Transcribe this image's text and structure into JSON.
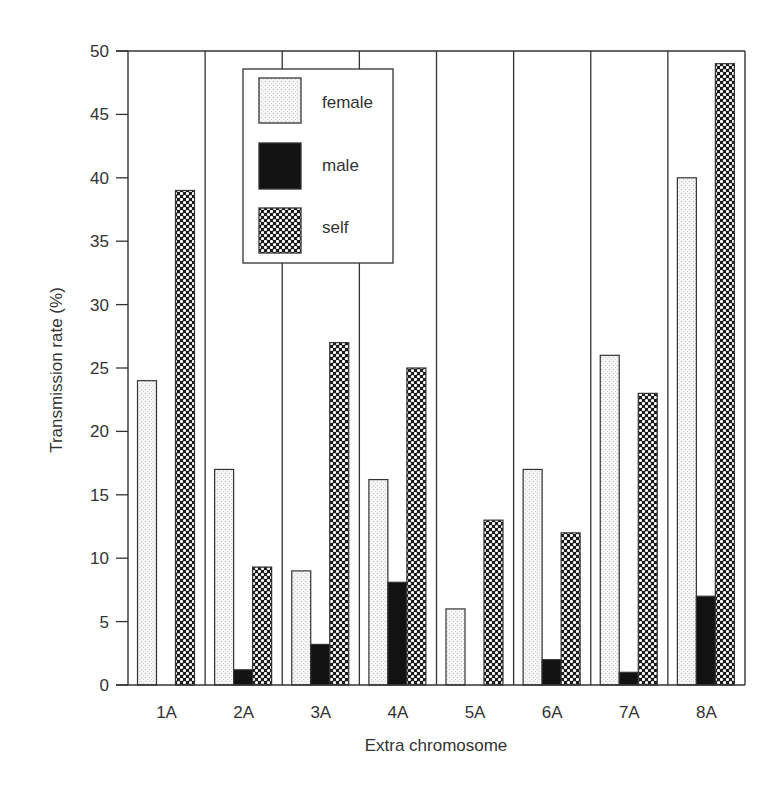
{
  "chart_data": {
    "type": "bar",
    "title": "",
    "xlabel": "Extra chromosome",
    "ylabel": "Transmission rate (%)",
    "ylim": [
      0,
      50
    ],
    "yticks": [
      0,
      5,
      10,
      15,
      20,
      25,
      30,
      35,
      40,
      45,
      50
    ],
    "grid": false,
    "group_dividers": true,
    "legend_position": "upper-left-center (inside plot)",
    "categories": [
      "1A",
      "2A",
      "3A",
      "4A",
      "5A",
      "6A",
      "7A",
      "8A"
    ],
    "series": [
      {
        "name": "female",
        "pattern": "light-stipple",
        "values": [
          24,
          17,
          9,
          16.2,
          6,
          17,
          26,
          40
        ]
      },
      {
        "name": "male",
        "pattern": "solid-black",
        "values": [
          0,
          1.2,
          3.2,
          8.1,
          0,
          2,
          1,
          7
        ]
      },
      {
        "name": "self",
        "pattern": "checkered",
        "values": [
          39,
          9.3,
          27,
          25,
          13,
          12,
          23,
          49
        ]
      }
    ]
  },
  "legend": {
    "items": [
      {
        "label": "female"
      },
      {
        "label": "male"
      },
      {
        "label": "self"
      }
    ]
  },
  "colors": {
    "axis": "#333333",
    "female_fill": "#f2f2f2",
    "male_fill": "#111111",
    "self_dark": "#222222",
    "self_light": "#ffffff"
  }
}
